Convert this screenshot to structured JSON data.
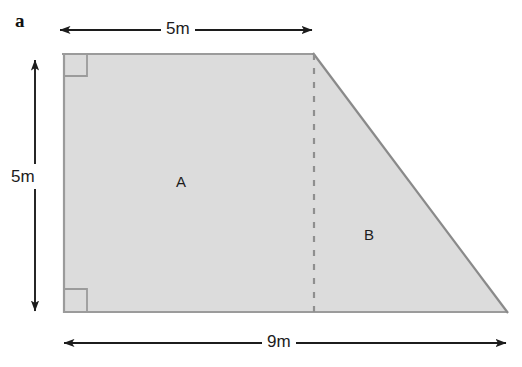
{
  "figure": {
    "item_letter": "a",
    "shape_name": "trapezium",
    "fill_color": "#dcdcdc",
    "stroke_color": "#999999",
    "slant_stroke_color": "#8a8a8a",
    "dash_color": "#8f8f8f",
    "arrow_color": "#1c1c1c",
    "background_color": "#ffffff",
    "regions": [
      {
        "id": "A",
        "label": "A",
        "kind": "rectangle"
      },
      {
        "id": "B",
        "label": "B",
        "kind": "triangle"
      }
    ],
    "dimensions": [
      {
        "id": "top",
        "label": "5m",
        "orientation": "horizontal",
        "edge": "top",
        "arrowheads": "both"
      },
      {
        "id": "left",
        "label": "5m",
        "orientation": "vertical",
        "edge": "left",
        "arrowheads": "both"
      },
      {
        "id": "bottom",
        "label": "9m",
        "orientation": "horizontal",
        "edge": "bottom",
        "arrowheads": "both"
      }
    ],
    "right_angle_markers": [
      {
        "id": "top-left",
        "corner": "top-left"
      },
      {
        "id": "bottom-left",
        "corner": "bottom-left"
      }
    ],
    "vertices": {
      "top_left": [
        63,
        53
      ],
      "top_right": [
        313,
        53
      ],
      "bottom_right": [
        508,
        313
      ],
      "bottom_left": [
        63,
        313
      ]
    },
    "divider": {
      "x": 314,
      "y_top": 53,
      "y_bottom": 313,
      "style": "dashed"
    }
  }
}
